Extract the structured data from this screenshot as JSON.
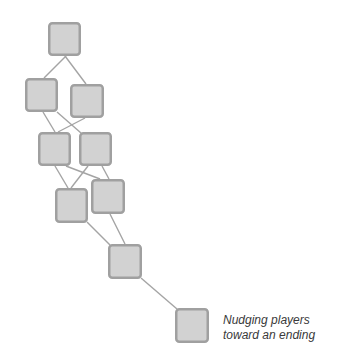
{
  "diagram": {
    "colors": {
      "node_fill": "#d2d2d2",
      "node_stroke": "#a0a0a0",
      "edge": "#a4a4a4",
      "caption_text": "#3a3a3a",
      "background": "#ffffff"
    },
    "nodes": [
      {
        "id": "n1",
        "x": 48,
        "y": 22,
        "w": 33,
        "h": 34
      },
      {
        "id": "n2",
        "x": 25,
        "y": 78,
        "w": 33,
        "h": 34
      },
      {
        "id": "n3",
        "x": 70,
        "y": 84,
        "w": 34,
        "h": 34
      },
      {
        "id": "n4",
        "x": 38,
        "y": 132,
        "w": 33,
        "h": 34
      },
      {
        "id": "n5",
        "x": 79,
        "y": 132,
        "w": 33,
        "h": 34
      },
      {
        "id": "n6",
        "x": 55,
        "y": 188,
        "w": 33,
        "h": 35
      },
      {
        "id": "n7",
        "x": 91,
        "y": 179,
        "w": 34,
        "h": 35
      },
      {
        "id": "n8",
        "x": 108,
        "y": 244,
        "w": 34,
        "h": 35
      },
      {
        "id": "n9",
        "x": 175,
        "y": 308,
        "w": 34,
        "h": 35
      }
    ],
    "edges": [
      {
        "from": "n1",
        "to": "n2",
        "x1": 66,
        "y1": 56,
        "x2": 44,
        "y2": 78
      },
      {
        "from": "n1",
        "to": "n3",
        "x1": 65,
        "y1": 56,
        "x2": 86,
        "y2": 84
      },
      {
        "from": "n2",
        "to": "n4",
        "x1": 43,
        "y1": 112,
        "x2": 55,
        "y2": 132
      },
      {
        "from": "n2",
        "to": "n5",
        "x1": 57,
        "y1": 112,
        "x2": 81,
        "y2": 133
      },
      {
        "from": "n3",
        "to": "n4",
        "x1": 85,
        "y1": 118,
        "x2": 58,
        "y2": 132
      },
      {
        "from": "n4",
        "to": "n6",
        "x1": 55,
        "y1": 166,
        "x2": 68,
        "y2": 188
      },
      {
        "from": "n4",
        "to": "n7",
        "x1": 66,
        "y1": 166,
        "x2": 100,
        "y2": 179
      },
      {
        "from": "n5",
        "to": "n6",
        "x1": 88,
        "y1": 166,
        "x2": 71,
        "y2": 188
      },
      {
        "from": "n5",
        "to": "n7",
        "x1": 102,
        "y1": 166,
        "x2": 109,
        "y2": 179
      },
      {
        "from": "n6",
        "to": "n8",
        "x1": 87,
        "y1": 222,
        "x2": 110,
        "y2": 245
      },
      {
        "from": "n7",
        "to": "n8",
        "x1": 110,
        "y1": 214,
        "x2": 125,
        "y2": 244
      },
      {
        "from": "n8",
        "to": "n9",
        "x1": 141,
        "y1": 278,
        "x2": 177,
        "y2": 309
      }
    ],
    "caption": {
      "line1": "Nudging players",
      "line2": "toward an ending"
    }
  }
}
